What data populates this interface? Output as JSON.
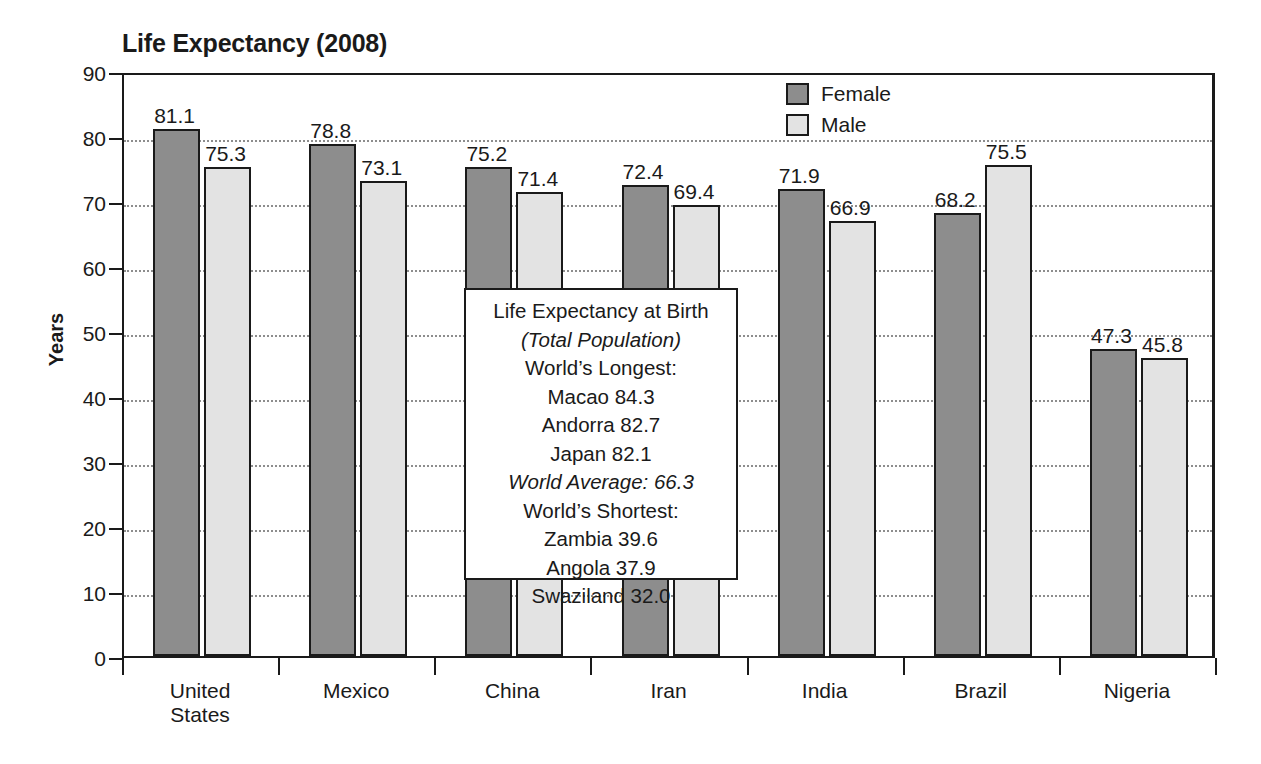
{
  "chart_data": {
    "type": "bar",
    "title": "Life Expectancy (2008)",
    "xlabel": "",
    "ylabel": "Years",
    "ylim": [
      0,
      90
    ],
    "ytick_step": 10,
    "yticks": [
      90,
      80,
      70,
      60,
      50,
      40,
      30,
      20,
      10,
      0
    ],
    "grid": true,
    "grid_axis": "y",
    "legend_position": "top-right",
    "categories": [
      "United States",
      "Mexico",
      "China",
      "Iran",
      "India",
      "Brazil",
      "Nigeria"
    ],
    "category_label_lines": [
      [
        "United",
        "States"
      ],
      [
        "Mexico"
      ],
      [
        "China"
      ],
      [
        "Iran"
      ],
      [
        "India"
      ],
      [
        "Brazil"
      ],
      [
        "Nigeria"
      ]
    ],
    "series": [
      {
        "name": "Female",
        "color": "#8d8d8d",
        "values": [
          81.1,
          78.8,
          75.2,
          72.4,
          71.9,
          68.2,
          47.3
        ],
        "labels": [
          "81.1",
          "78.8",
          "75.2",
          "72.4",
          "71.9",
          "68.2",
          "47.3"
        ]
      },
      {
        "name": "Male",
        "color": "#e3e3e3",
        "values": [
          75.3,
          73.1,
          71.4,
          69.4,
          66.9,
          75.5,
          45.8
        ],
        "labels": [
          "75.3",
          "73.1",
          "71.4",
          "69.4",
          "66.9",
          "75.5",
          "45.8"
        ]
      }
    ],
    "annotation_box": {
      "lines": [
        {
          "text": "Life Expectancy at Birth",
          "italic": false
        },
        {
          "text": "(Total Population)",
          "italic": true
        },
        {
          "text": "World’s Longest:",
          "italic": false
        },
        {
          "text": "Macao 84.3",
          "italic": false
        },
        {
          "text": "Andorra 82.7",
          "italic": false
        },
        {
          "text": "Japan 82.1",
          "italic": false
        },
        {
          "text": "World Average: 66.3",
          "italic": true
        },
        {
          "text": "World’s Shortest:",
          "italic": false
        },
        {
          "text": "Zambia 39.6",
          "italic": false
        },
        {
          "text": "Angola 37.9",
          "italic": false
        },
        {
          "text": "Swaziland 32.0",
          "italic": false
        }
      ]
    }
  },
  "colors": {
    "female_bar": "#8d8d8d",
    "male_bar": "#e3e3e3",
    "outline": "#1a1a1a",
    "gridline": "#8d8d8d",
    "background": "#ffffff"
  }
}
